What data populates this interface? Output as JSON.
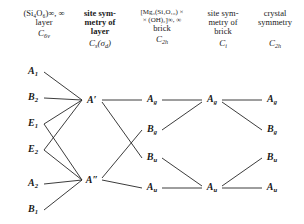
{
  "header": {
    "columns": [
      {
        "id": "layer-formula",
        "lines": [
          "(Si₄O₆)∞, ∞",
          "layer"
        ],
        "bold_lines": [
          false,
          false
        ],
        "symmetry": "C6v",
        "symmetry_main": "C",
        "symmetry_sub": "6v"
      },
      {
        "id": "site-symmetry-layer",
        "lines": [
          "site sym-",
          "metry of",
          "layer"
        ],
        "bold_lines": [
          true,
          true,
          true
        ],
        "symmetry": "Cs(σd)",
        "symmetry_main": "C",
        "symmetry_sub": "s",
        "symmetry_tail": "(σ",
        "symmetry_tail_sub": "d",
        "symmetry_tail_end": ")"
      },
      {
        "id": "brick-formula",
        "lines": [
          "[Mg₃(Si₄O₁₀) ×",
          "× (OH)₂]∞, ∞",
          "brick"
        ],
        "bold_lines": [
          false,
          false,
          false
        ],
        "symmetry": "C2h",
        "symmetry_main": "C",
        "symmetry_sub": "2h"
      },
      {
        "id": "site-symmetry-brick",
        "lines": [
          "site sym-",
          "metry of",
          "brick"
        ],
        "bold_lines": [
          false,
          false,
          false
        ],
        "symmetry": "Ci",
        "symmetry_main": "C",
        "symmetry_sub": "i"
      },
      {
        "id": "crystal-symmetry",
        "lines": [
          "crystal",
          "symmetry"
        ],
        "bold_lines": [
          false,
          false
        ],
        "symmetry": "C2h",
        "symmetry_main": "C",
        "symmetry_sub": "2h"
      }
    ]
  },
  "diagram": {
    "type": "correlation-diagram",
    "columns": [
      {
        "id": "col-c6v",
        "x": 33,
        "terms": [
          {
            "label": "A1",
            "main": "A",
            "sub": "1",
            "y": 14
          },
          {
            "label": "B2",
            "main": "B",
            "sub": "2",
            "y": 40
          },
          {
            "label": "E1",
            "main": "E",
            "sub": "1",
            "y": 66
          },
          {
            "label": "E2",
            "main": "E",
            "sub": "2",
            "y": 92
          },
          {
            "label": "A2",
            "main": "A",
            "sub": "2",
            "y": 126
          },
          {
            "label": "B1",
            "main": "B",
            "sub": "1",
            "y": 152
          }
        ]
      },
      {
        "id": "col-cs",
        "x": 92,
        "terms": [
          {
            "label": "A'",
            "main": "A",
            "prime": "′",
            "y": 42
          },
          {
            "label": "A″",
            "main": "A",
            "prime": "″",
            "y": 122
          }
        ]
      },
      {
        "id": "col-c2h-brick",
        "x": 152,
        "terms": [
          {
            "label": "Ag",
            "main": "A",
            "sub": "g",
            "y": 42
          },
          {
            "label": "Bg",
            "main": "B",
            "sub": "g",
            "y": 72
          },
          {
            "label": "Bu",
            "main": "B",
            "sub": "u",
            "y": 100
          },
          {
            "label": "Au",
            "main": "A",
            "sub": "u",
            "y": 130
          }
        ]
      },
      {
        "id": "col-ci",
        "x": 212,
        "terms": [
          {
            "label": "Ag",
            "main": "A",
            "sub": "g",
            "y": 42
          },
          {
            "label": "Au",
            "main": "A",
            "sub": "u",
            "y": 130
          }
        ]
      },
      {
        "id": "col-c2h-crystal",
        "x": 272,
        "terms": [
          {
            "label": "Ag",
            "main": "A",
            "sub": "g",
            "y": 42
          },
          {
            "label": "Bg",
            "main": "B",
            "sub": "g",
            "y": 72
          },
          {
            "label": "Bu",
            "main": "B",
            "sub": "u",
            "y": 100
          },
          {
            "label": "Au",
            "main": "A",
            "sub": "u",
            "y": 130
          }
        ]
      }
    ],
    "links": [
      {
        "from": "col-c6v.A1",
        "to": "col-cs.A'",
        "x1": 44,
        "y1": 14,
        "x2": 82,
        "y2": 42
      },
      {
        "from": "col-c6v.B2",
        "to": "col-cs.A'",
        "x1": 44,
        "y1": 40,
        "x2": 82,
        "y2": 42
      },
      {
        "from": "col-c6v.E1",
        "to": "col-cs.A'",
        "x1": 44,
        "y1": 66,
        "x2": 82,
        "y2": 42
      },
      {
        "from": "col-c6v.E2",
        "to": "col-cs.A'",
        "x1": 44,
        "y1": 92,
        "x2": 82,
        "y2": 42
      },
      {
        "from": "col-c6v.E1",
        "to": "col-cs.A″",
        "x1": 44,
        "y1": 66,
        "x2": 82,
        "y2": 122
      },
      {
        "from": "col-c6v.E2",
        "to": "col-cs.A″",
        "x1": 44,
        "y1": 92,
        "x2": 82,
        "y2": 122
      },
      {
        "from": "col-c6v.A2",
        "to": "col-cs.A″",
        "x1": 44,
        "y1": 126,
        "x2": 82,
        "y2": 122
      },
      {
        "from": "col-c6v.B1",
        "to": "col-cs.A″",
        "x1": 44,
        "y1": 152,
        "x2": 82,
        "y2": 122
      },
      {
        "from": "col-cs.A'",
        "to": "col-c2h-brick.Ag",
        "x1": 102,
        "y1": 42,
        "x2": 142,
        "y2": 42
      },
      {
        "from": "col-cs.A'",
        "to": "col-c2h-brick.Bu",
        "x1": 102,
        "y1": 44,
        "x2": 142,
        "y2": 100
      },
      {
        "from": "col-cs.A″",
        "to": "col-c2h-brick.Bg",
        "x1": 102,
        "y1": 120,
        "x2": 142,
        "y2": 72
      },
      {
        "from": "col-cs.A″",
        "to": "col-c2h-brick.Au",
        "x1": 102,
        "y1": 122,
        "x2": 142,
        "y2": 130
      },
      {
        "from": "col-c2h-brick.Ag",
        "to": "col-ci.Ag",
        "x1": 162,
        "y1": 42,
        "x2": 202,
        "y2": 42
      },
      {
        "from": "col-c2h-brick.Bg",
        "to": "col-ci.Ag",
        "x1": 162,
        "y1": 72,
        "x2": 202,
        "y2": 44
      },
      {
        "from": "col-c2h-brick.Bu",
        "to": "col-ci.Au",
        "x1": 162,
        "y1": 100,
        "x2": 202,
        "y2": 128
      },
      {
        "from": "col-c2h-brick.Au",
        "to": "col-ci.Au",
        "x1": 162,
        "y1": 130,
        "x2": 202,
        "y2": 130
      },
      {
        "from": "col-ci.Ag",
        "to": "col-c2h-crystal.Ag",
        "x1": 222,
        "y1": 42,
        "x2": 262,
        "y2": 42
      },
      {
        "from": "col-ci.Ag",
        "to": "col-c2h-crystal.Bg",
        "x1": 222,
        "y1": 44,
        "x2": 262,
        "y2": 72
      },
      {
        "from": "col-ci.Au",
        "to": "col-c2h-crystal.Bu",
        "x1": 222,
        "y1": 128,
        "x2": 262,
        "y2": 100
      },
      {
        "from": "col-ci.Au",
        "to": "col-c2h-crystal.Au",
        "x1": 222,
        "y1": 130,
        "x2": 262,
        "y2": 130
      }
    ]
  },
  "style": {
    "line_color": "#262626",
    "text_color": "#1a1a1a",
    "background": "#ffffff"
  }
}
